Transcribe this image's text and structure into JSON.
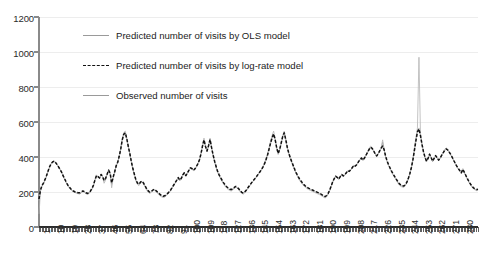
{
  "chart_data": {
    "type": "line",
    "title": "",
    "xlabel": "",
    "ylabel": "",
    "ylim": [
      0,
      1200
    ],
    "yticks": [
      0,
      200,
      400,
      600,
      800,
      1000,
      1200
    ],
    "xlim": [
      1,
      288
    ],
    "xticks": [
      1,
      10,
      19,
      28,
      37,
      46,
      55,
      64,
      73,
      82,
      91,
      100,
      109,
      118,
      127,
      136,
      145,
      154,
      163,
      172,
      181,
      190,
      199,
      208,
      217,
      226,
      235,
      244,
      253,
      262,
      271,
      280
    ],
    "grid": "horizontal",
    "legend_position": "upper-left-inside",
    "legend": [
      {
        "label": "Predicted number of visits by OLS model",
        "style": "solid",
        "color": "#9a9a9a"
      },
      {
        "label": "Predicted number of visits by log-rate model",
        "style": "dashed",
        "color": "#111111"
      },
      {
        "label": "Observed number of visits",
        "style": "solid",
        "color": "#9a9a9a"
      }
    ],
    "annotations": [
      "Sharp observed spike near x=253 reaching approximately 970"
    ],
    "series": [
      {
        "name": "Observed number of visits",
        "style": "solid",
        "color": "#b4b4b4",
        "values": [
          75,
          205,
          232,
          246,
          268,
          290,
          318,
          344,
          362,
          374,
          378,
          370,
          358,
          344,
          330,
          312,
          292,
          272,
          252,
          236,
          224,
          214,
          206,
          200,
          196,
          192,
          190,
          188,
          196,
          204,
          198,
          190,
          186,
          190,
          200,
          216,
          236,
          272,
          298,
          288,
          276,
          302,
          286,
          250,
          268,
          304,
          330,
          306,
          224,
          278,
          316,
          352,
          372,
          408,
          452,
          506,
          540,
          548,
          508,
          460,
          420,
          372,
          330,
          296,
          262,
          244,
          236,
          252,
          260,
          246,
          230,
          212,
          200,
          192,
          196,
          206,
          212,
          206,
          196,
          186,
          178,
          172,
          168,
          170,
          178,
          186,
          196,
          208,
          222,
          238,
          254,
          268,
          284,
          264,
          276,
          300,
          312,
          290,
          308,
          326,
          340,
          336,
          322,
          330,
          346,
          362,
          386,
          422,
          470,
          508,
          462,
          432,
          466,
          508,
          456,
          410,
          372,
          340,
          312,
          292,
          274,
          258,
          244,
          232,
          222,
          214,
          208,
          206,
          212,
          220,
          228,
          222,
          212,
          200,
          192,
          188,
          196,
          206,
          220,
          232,
          246,
          258,
          268,
          280,
          292,
          306,
          318,
          330,
          348,
          366,
          392,
          420,
          456,
          492,
          524,
          548,
          506,
          452,
          414,
          440,
          480,
          524,
          548,
          504,
          456,
          420,
          392,
          368,
          344,
          322,
          302,
          284,
          268,
          256,
          244,
          234,
          226,
          220,
          214,
          210,
          206,
          202,
          198,
          194,
          190,
          186,
          182,
          176,
          170,
          166,
          172,
          186,
          206,
          232,
          258,
          278,
          292,
          284,
          272,
          288,
          300,
          290,
          296,
          310,
          322,
          316,
          328,
          342,
          354,
          348,
          360,
          374,
          388,
          398,
          382,
          396,
          412,
          430,
          448,
          462,
          454,
          438,
          420,
          404,
          418,
          436,
          452,
          498,
          442,
          400,
          372,
          350,
          330,
          312,
          296,
          282,
          268,
          252,
          240,
          232,
          228,
          226,
          236,
          252,
          276,
          306,
          344,
          392,
          452,
          512,
          566,
          970,
          536,
          478,
          432,
          396,
          372,
          392,
          420,
          398,
          374,
          392,
          410,
          396,
          380,
          394,
          412,
          428,
          444,
          452,
          444,
          430,
          414,
          396,
          378,
          360,
          344,
          330,
          318,
          306,
          334,
          312,
          290,
          272,
          256,
          242,
          228,
          218,
          212,
          208,
          210
        ]
      },
      {
        "name": "Predicted number of visits by OLS model",
        "style": "solid",
        "color": "#a8a8a8",
        "values": [
          150,
          210,
          236,
          250,
          270,
          292,
          318,
          342,
          360,
          370,
          374,
          366,
          354,
          340,
          326,
          310,
          290,
          272,
          254,
          238,
          226,
          216,
          208,
          202,
          198,
          196,
          194,
          194,
          198,
          204,
          200,
          194,
          190,
          194,
          204,
          218,
          238,
          268,
          292,
          286,
          278,
          298,
          288,
          262,
          274,
          300,
          322,
          304,
          244,
          282,
          314,
          348,
          368,
          402,
          444,
          496,
          528,
          536,
          502,
          458,
          418,
          372,
          332,
          300,
          268,
          250,
          242,
          254,
          260,
          250,
          234,
          218,
          206,
          198,
          200,
          208,
          214,
          208,
          200,
          192,
          184,
          178,
          174,
          176,
          182,
          190,
          200,
          210,
          224,
          238,
          252,
          266,
          280,
          266,
          276,
          296,
          308,
          292,
          306,
          322,
          336,
          332,
          322,
          330,
          344,
          360,
          382,
          416,
          460,
          496,
          458,
          432,
          462,
          498,
          452,
          410,
          374,
          344,
          316,
          296,
          280,
          264,
          250,
          238,
          228,
          220,
          214,
          212,
          216,
          224,
          230,
          224,
          216,
          204,
          196,
          192,
          200,
          210,
          222,
          234,
          246,
          258,
          268,
          278,
          290,
          302,
          314,
          326,
          342,
          360,
          384,
          410,
          444,
          478,
          508,
          530,
          498,
          452,
          418,
          442,
          478,
          516,
          536,
          498,
          454,
          420,
          394,
          370,
          348,
          326,
          306,
          290,
          274,
          262,
          250,
          240,
          232,
          226,
          220,
          216,
          212,
          208,
          204,
          200,
          196,
          192,
          188,
          182,
          176,
          172,
          178,
          190,
          208,
          232,
          256,
          274,
          288,
          282,
          272,
          286,
          298,
          290,
          296,
          308,
          320,
          316,
          326,
          338,
          350,
          346,
          356,
          370,
          382,
          392,
          380,
          392,
          408,
          424,
          440,
          454,
          448,
          434,
          418,
          404,
          416,
          432,
          448,
          484,
          440,
          402,
          374,
          352,
          334,
          316,
          300,
          286,
          272,
          258,
          246,
          238,
          234,
          232,
          240,
          254,
          276,
          304,
          338,
          382,
          436,
          492,
          542,
          566,
          520,
          470,
          428,
          396,
          374,
          390,
          414,
          396,
          374,
          390,
          406,
          394,
          380,
          392,
          408,
          422,
          436,
          444,
          438,
          426,
          412,
          396,
          378,
          362,
          346,
          332,
          320,
          308,
          328,
          310,
          292,
          274,
          258,
          244,
          232,
          222,
          216,
          212,
          214
        ]
      },
      {
        "name": "Predicted number of visits by log-rate model",
        "style": "dashed",
        "color": "#111111",
        "values": [
          160,
          212,
          238,
          252,
          272,
          294,
          320,
          344,
          362,
          372,
          376,
          368,
          356,
          342,
          328,
          312,
          292,
          274,
          256,
          240,
          228,
          218,
          210,
          204,
          200,
          198,
          196,
          196,
          200,
          206,
          202,
          196,
          192,
          196,
          206,
          220,
          240,
          270,
          294,
          288,
          280,
          300,
          290,
          266,
          278,
          302,
          324,
          308,
          252,
          286,
          316,
          350,
          370,
          404,
          446,
          498,
          530,
          538,
          504,
          460,
          420,
          374,
          334,
          302,
          270,
          252,
          244,
          256,
          262,
          252,
          236,
          220,
          208,
          200,
          202,
          210,
          216,
          210,
          202,
          194,
          186,
          180,
          176,
          178,
          184,
          192,
          202,
          212,
          226,
          240,
          254,
          268,
          282,
          268,
          278,
          298,
          310,
          294,
          308,
          324,
          338,
          334,
          324,
          332,
          346,
          362,
          384,
          418,
          462,
          498,
          460,
          434,
          464,
          500,
          454,
          412,
          376,
          346,
          318,
          298,
          282,
          266,
          252,
          240,
          230,
          222,
          216,
          214,
          218,
          226,
          232,
          226,
          218,
          206,
          198,
          194,
          202,
          212,
          224,
          236,
          248,
          260,
          270,
          280,
          292,
          304,
          316,
          328,
          344,
          362,
          386,
          412,
          446,
          480,
          510,
          532,
          500,
          454,
          420,
          444,
          480,
          518,
          538,
          500,
          456,
          422,
          396,
          372,
          350,
          328,
          308,
          292,
          276,
          264,
          252,
          242,
          234,
          228,
          222,
          218,
          214,
          210,
          206,
          202,
          198,
          194,
          190,
          184,
          178,
          174,
          180,
          192,
          210,
          234,
          258,
          276,
          290,
          284,
          274,
          288,
          300,
          292,
          298,
          310,
          322,
          318,
          328,
          340,
          352,
          348,
          358,
          372,
          384,
          394,
          382,
          394,
          410,
          426,
          442,
          456,
          450,
          436,
          420,
          406,
          418,
          434,
          450,
          462,
          442,
          404,
          376,
          354,
          336,
          318,
          302,
          288,
          274,
          260,
          248,
          240,
          236,
          234,
          242,
          256,
          278,
          306,
          340,
          384,
          438,
          494,
          544,
          560,
          522,
          472,
          430,
          398,
          376,
          392,
          416,
          398,
          376,
          392,
          408,
          396,
          382,
          394,
          410,
          424,
          438,
          446,
          440,
          428,
          414,
          398,
          380,
          364,
          348,
          334,
          322,
          310,
          330,
          312,
          294,
          276,
          260,
          246,
          234,
          224,
          218,
          214,
          216
        ]
      }
    ]
  }
}
